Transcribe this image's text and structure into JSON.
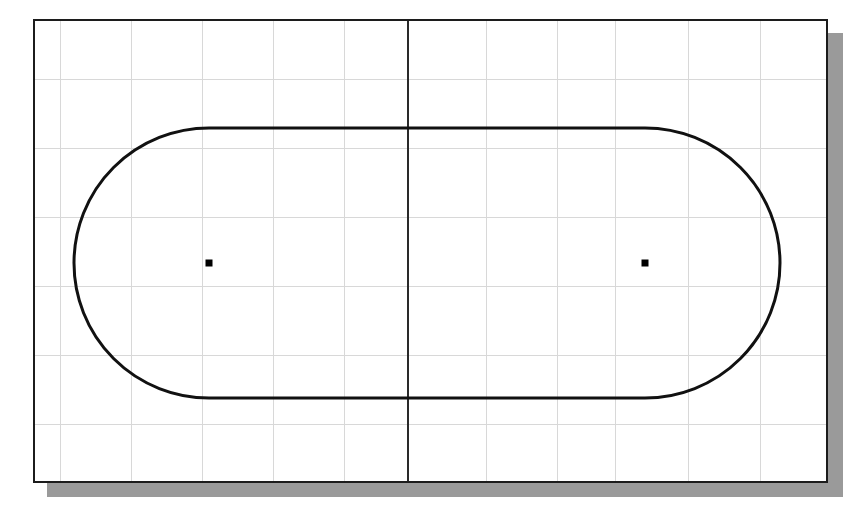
{
  "app": {
    "title": "CAD Sketch View",
    "background_color": "#ffffff"
  },
  "sheet": {
    "name": "drawing-sheet",
    "x": 33,
    "y": 19,
    "width": 795,
    "height": 464,
    "border_color": "#1c1c1c",
    "fill_color": "#ffffff",
    "shadow_color": "#9a9a9a",
    "shadow_offset": 14
  },
  "grid": {
    "color": "#d8d8d8",
    "spacing_x": 71,
    "spacing_y": 69,
    "vertical_x": [
      25,
      96,
      167,
      238,
      309,
      380,
      451,
      522,
      580,
      653,
      725
    ],
    "horizontal_y": [
      58,
      127,
      196,
      265,
      334,
      403
    ]
  },
  "center_axis": {
    "name": "vertical-centerline",
    "x": 373,
    "color": "#2a2a2a",
    "y_start": 0,
    "y_end": 464
  },
  "geometry": {
    "shape": "slot",
    "description": "obround slot profile",
    "stroke_color": "#111111",
    "stroke_width": 3,
    "left_center_x": 174,
    "right_center_x": 610,
    "center_y": 242,
    "radius": 135,
    "top_y": 109,
    "bottom_y": 378,
    "left_extreme_x": 45,
    "right_extreme_x": 746
  },
  "center_marks": [
    {
      "name": "left-center-point",
      "x": 174,
      "y": 242,
      "size": 7,
      "color": "#000000"
    },
    {
      "name": "right-center-point",
      "x": 610,
      "y": 242,
      "size": 7,
      "color": "#000000"
    }
  ],
  "chart_data": {
    "type": "table",
    "categories": [
      "left arc center",
      "right arc center",
      "arc radius",
      "slot overall length",
      "slot overall height"
    ],
    "values": [
      174,
      610,
      135,
      701,
      269
    ],
    "xlabel": "feature",
    "ylabel": "pixels"
  }
}
